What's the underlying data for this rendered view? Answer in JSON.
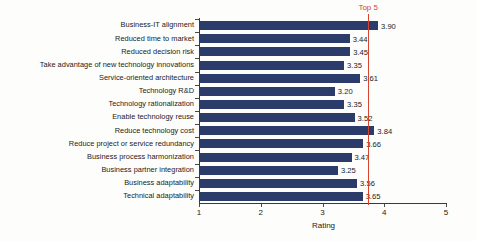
{
  "chart_data": {
    "type": "bar",
    "orientation": "horizontal",
    "title": "",
    "xlabel": "Rating",
    "ylabel": "",
    "xlim": [
      1,
      5
    ],
    "xticks": [
      "1",
      "2",
      "3",
      "4",
      "5"
    ],
    "grid": false,
    "legend": null,
    "categories": [
      "Business-IT alignment",
      "Reduced time to market",
      "Reduced decision risk",
      "Take advantage of new technology innovations",
      "Service-oriented architecture",
      "Technology R&D",
      "Technology rationalization",
      "Enable technology reuse",
      "Reduce technology cost",
      "Reduce project or service redundancy",
      "Business process harmonization",
      "Business partner integration",
      "Business adaptability",
      "Technical adaptability"
    ],
    "values": [
      3.9,
      3.44,
      3.45,
      3.35,
      3.61,
      3.2,
      3.35,
      3.52,
      3.84,
      3.66,
      3.47,
      3.25,
      3.56,
      3.65
    ],
    "value_labels": [
      "3.90",
      "3.44",
      "3.45",
      "3.35",
      "3.61",
      "3.20",
      "3.35",
      "3.52",
      "3.84",
      "3.66",
      "3.47",
      "3.25",
      "3.56",
      "3.65"
    ],
    "bar_color": "#2b3c6b",
    "annotations": [
      {
        "name": "top-5-threshold",
        "label": "Top 5",
        "value": 3.74,
        "color": "#d4442e",
        "style": "vertical-line"
      }
    ]
  }
}
